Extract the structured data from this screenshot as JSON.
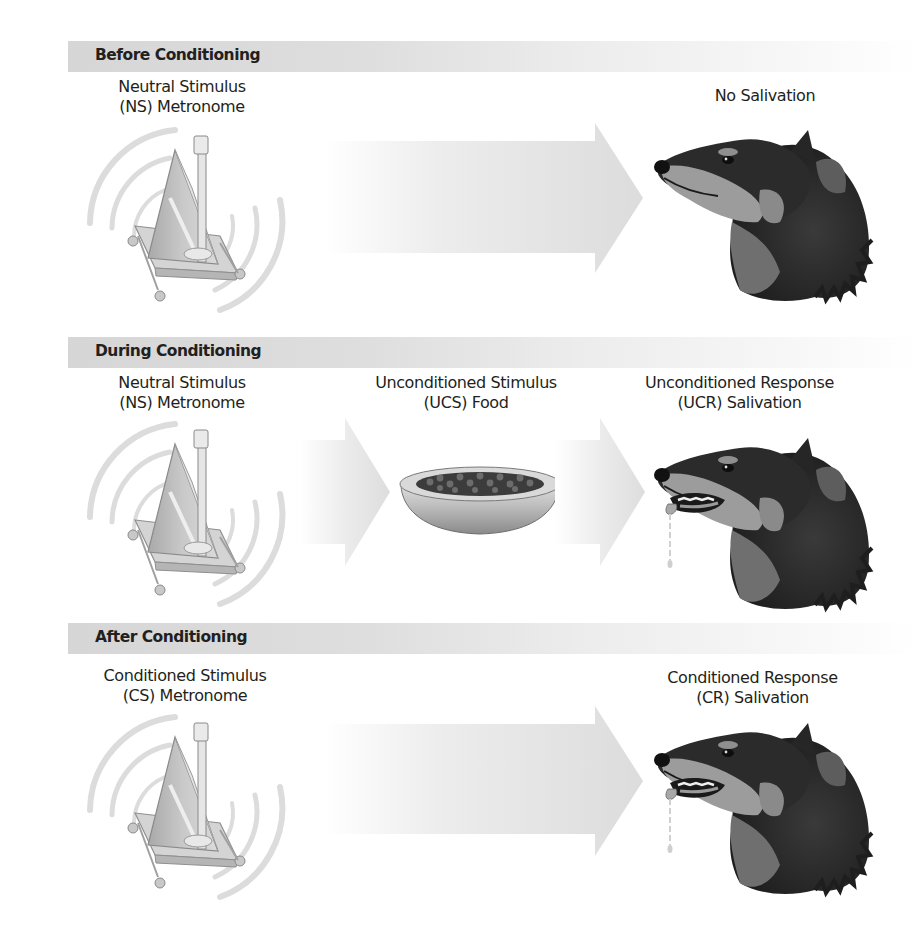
{
  "diagram": {
    "stages": [
      {
        "id": "before",
        "header": "Before Conditioning",
        "items": [
          {
            "role": "stimulus",
            "line1": "Neutral Stimulus",
            "line2": "(NS) Metronome",
            "icon": "metronome-icon"
          },
          {
            "role": "arrow",
            "icon": "arrow-right-icon"
          },
          {
            "role": "response",
            "line1": "No Salivation",
            "line2": "",
            "icon": "dog-head-icon"
          }
        ]
      },
      {
        "id": "during",
        "header": "During Conditioning",
        "items": [
          {
            "role": "stimulus",
            "line1": "Neutral Stimulus",
            "line2": "(NS) Metronome",
            "icon": "metronome-icon"
          },
          {
            "role": "arrow",
            "icon": "arrow-right-icon"
          },
          {
            "role": "stimulus",
            "line1": "Unconditioned Stimulus",
            "line2": "(UCS) Food",
            "icon": "food-bowl-icon"
          },
          {
            "role": "arrow",
            "icon": "arrow-right-icon"
          },
          {
            "role": "response",
            "line1": "Unconditioned Response",
            "line2": "(UCR) Salivation",
            "icon": "salivating-dog-icon"
          }
        ]
      },
      {
        "id": "after",
        "header": "After Conditioning",
        "items": [
          {
            "role": "stimulus",
            "line1": "Conditioned Stimulus",
            "line2": "(CS) Metronome",
            "icon": "metronome-icon"
          },
          {
            "role": "arrow",
            "icon": "arrow-right-icon"
          },
          {
            "role": "response",
            "line1": "Conditioned Response",
            "line2": "(CR) Salivation",
            "icon": "salivating-dog-icon"
          }
        ]
      }
    ]
  },
  "colors": {
    "header_bar": "#d6d6d6",
    "text": "#231f20",
    "arrow": "#e4e4e4",
    "metronome": "#bdbdbd",
    "dog_dark": "#2a2a2a",
    "dog_tan": "#9a9a9a",
    "bowl": "#c8c8c8"
  }
}
